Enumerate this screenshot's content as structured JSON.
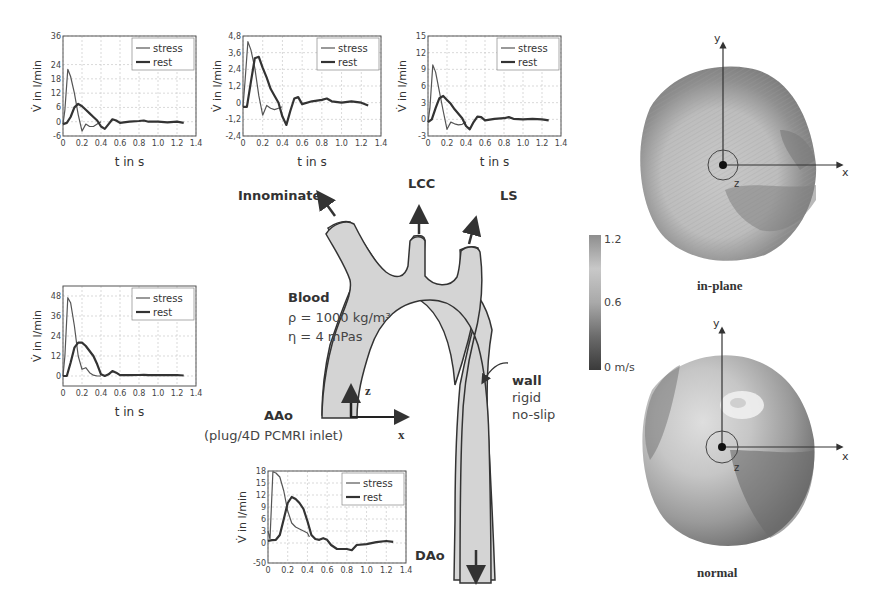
{
  "figure": {
    "aorta": {
      "labels": {
        "innominate": "Innominate",
        "lcc": "LCC",
        "ls": "LS",
        "aao": "AAo",
        "aao_sub": "(plug/4D PCMRI inlet)",
        "dao": "DAo",
        "blood": "Blood",
        "rho": "ρ = 1000 kg/m³",
        "eta": "η =  4 mPas",
        "wall": "wall",
        "wall_l1": "rigid",
        "wall_l2": "no-slip",
        "axis_z": "z",
        "axis_x": "x"
      },
      "fill_color": "#d6d6d6",
      "stroke_color": "#333333"
    },
    "colorbar": {
      "max_label": "1.2",
      "mid_label": "0.6",
      "min_label": "0 m/s"
    },
    "cross_sections": [
      {
        "caption": "in-plane",
        "axis_x": "x",
        "axis_y": "y",
        "axis_z": "z"
      },
      {
        "caption": "normal",
        "axis_x": "x",
        "axis_y": "y",
        "axis_z": "z"
      }
    ]
  },
  "chart_data": [
    {
      "id": "innominate",
      "type": "line",
      "title": "",
      "xlabel": "t in s",
      "ylabel": "V̇ in l/min",
      "xlim": [
        0,
        1.4
      ],
      "ylim": [
        -6,
        36
      ],
      "xticks": [
        "0",
        "0.2",
        "0.4",
        "0.6",
        "0.8",
        "1.0",
        "1.2",
        "1.4"
      ],
      "yticks": [
        "-6",
        "0",
        "6",
        "12",
        "18",
        "24",
        "36"
      ],
      "ytick_values": [
        -6,
        0,
        6,
        12,
        18,
        24,
        36
      ],
      "grid": true,
      "legend": [
        "stress",
        "rest"
      ],
      "legend_position": "upper right",
      "series": [
        {
          "name": "stress",
          "x": [
            0,
            0.02,
            0.05,
            0.08,
            0.12,
            0.16,
            0.2,
            0.24,
            0.28,
            0.32,
            0.36,
            0.4
          ],
          "values": [
            -1,
            5,
            22,
            19,
            12,
            3,
            -4,
            -1,
            -2,
            -2,
            -1,
            0
          ]
        },
        {
          "name": "rest",
          "x": [
            0,
            0.04,
            0.08,
            0.12,
            0.16,
            0.2,
            0.24,
            0.28,
            0.32,
            0.36,
            0.4,
            0.44,
            0.48,
            0.52,
            0.56,
            0.6,
            0.7,
            0.8,
            0.85,
            0.9,
            1.0,
            1.1,
            1.2,
            1.27
          ],
          "values": [
            -1,
            -0.5,
            2,
            6,
            7.5,
            6.5,
            5,
            3.5,
            2,
            0.5,
            -2,
            -3,
            -1,
            1,
            0.5,
            -0.5,
            0,
            0.3,
            0.5,
            0,
            0,
            -0.3,
            0,
            -0.5
          ]
        }
      ]
    },
    {
      "id": "lcc",
      "type": "line",
      "title": "",
      "xlabel": "t in s",
      "ylabel": "V̇ in l/min",
      "xlim": [
        0,
        1.4
      ],
      "ylim": [
        -2.4,
        4.8
      ],
      "xticks": [
        "0",
        "0.2",
        "0.4",
        "0.6",
        "0.8",
        "1.0",
        "1.2",
        "1.4"
      ],
      "yticks": [
        "-2,4",
        "-1,2",
        "0",
        "1,2",
        "2,4",
        "3,6",
        "4,8"
      ],
      "ytick_values": [
        -2.4,
        -1.2,
        0,
        1.2,
        2.4,
        3.6,
        4.8
      ],
      "grid": true,
      "legend": [
        "stress",
        "rest"
      ],
      "legend_position": "upper right",
      "series": [
        {
          "name": "stress",
          "x": [
            0,
            0.02,
            0.05,
            0.08,
            0.12,
            0.16,
            0.2,
            0.24,
            0.28,
            0.32,
            0.36,
            0.4
          ],
          "values": [
            -0.3,
            1.5,
            4.4,
            3.8,
            2.5,
            0.5,
            -0.9,
            -0.2,
            -0.4,
            -0.5,
            -0.4,
            -0.3
          ]
        },
        {
          "name": "rest",
          "x": [
            0,
            0.04,
            0.08,
            0.12,
            0.16,
            0.2,
            0.24,
            0.28,
            0.32,
            0.36,
            0.4,
            0.44,
            0.48,
            0.52,
            0.56,
            0.6,
            0.7,
            0.8,
            0.85,
            0.9,
            1.0,
            1.1,
            1.2,
            1.27
          ],
          "values": [
            -0.3,
            -0.3,
            1.5,
            3.2,
            3.3,
            2.5,
            1.8,
            1.0,
            0.5,
            0,
            -1.0,
            -1.6,
            -0.6,
            0.3,
            0.4,
            -0.1,
            0.1,
            0.2,
            0.3,
            0.1,
            0.0,
            0.1,
            0.0,
            -0.2
          ]
        }
      ]
    },
    {
      "id": "ls",
      "type": "line",
      "title": "",
      "xlabel": "t in s",
      "ylabel": "V̇ in l/min",
      "xlim": [
        0,
        1.4
      ],
      "ylim": [
        -3,
        15
      ],
      "xticks": [
        "0",
        "0.2",
        "0.4",
        "0.6",
        "0.8",
        "1.0",
        "1.2",
        "1.4"
      ],
      "yticks": [
        "-3",
        "0",
        "3",
        "6",
        "9",
        "12",
        "15"
      ],
      "ytick_values": [
        -3,
        0,
        3,
        6,
        9,
        12,
        15
      ],
      "grid": true,
      "legend": [
        "stress",
        "rest"
      ],
      "legend_position": "upper right",
      "series": [
        {
          "name": "stress",
          "x": [
            0,
            0.02,
            0.05,
            0.08,
            0.12,
            0.16,
            0.2,
            0.24,
            0.28,
            0.32,
            0.36,
            0.4
          ],
          "values": [
            -0.5,
            2,
            9.8,
            8.5,
            5,
            1.5,
            -1.8,
            -0.5,
            -0.8,
            -1.0,
            -0.9,
            -0.5
          ]
        },
        {
          "name": "rest",
          "x": [
            0,
            0.04,
            0.08,
            0.12,
            0.16,
            0.2,
            0.24,
            0.28,
            0.32,
            0.36,
            0.4,
            0.44,
            0.48,
            0.52,
            0.56,
            0.6,
            0.7,
            0.8,
            0.85,
            0.9,
            1.0,
            1.1,
            1.2,
            1.27
          ],
          "values": [
            -0.5,
            0,
            2,
            3.8,
            4.2,
            3.5,
            2.8,
            1.8,
            1.0,
            0.2,
            -1.2,
            -1.8,
            -0.5,
            0.5,
            0.4,
            -0.2,
            0.1,
            0.2,
            0.4,
            0.1,
            0.0,
            0.1,
            0.0,
            -0.2
          ]
        }
      ]
    },
    {
      "id": "left-outlet",
      "type": "line",
      "title": "",
      "xlabel": "t in s",
      "ylabel": "V̇ in l/min",
      "xlim": [
        0,
        1.4
      ],
      "ylim": [
        -6,
        54
      ],
      "xticks": [
        "0",
        "0.2",
        "0.4",
        "0.6",
        "0.8",
        "1.0",
        "1.2",
        "1.4"
      ],
      "yticks": [
        "0",
        "12",
        "24",
        "36",
        "48"
      ],
      "ytick_values": [
        0,
        12,
        24,
        36,
        48
      ],
      "grid": true,
      "legend": [
        "stress",
        "rest"
      ],
      "legend_position": "upper right",
      "series": [
        {
          "name": "stress",
          "x": [
            0,
            0.02,
            0.05,
            0.08,
            0.12,
            0.16,
            0.2,
            0.24,
            0.28,
            0.32,
            0.36,
            0.4
          ],
          "values": [
            0,
            12,
            47,
            44,
            30,
            12,
            4,
            5,
            2,
            0.5,
            0,
            0
          ]
        },
        {
          "name": "rest",
          "x": [
            0,
            0.04,
            0.08,
            0.12,
            0.16,
            0.2,
            0.24,
            0.28,
            0.32,
            0.36,
            0.4,
            0.44,
            0.48,
            0.52,
            0.56,
            0.6,
            0.7,
            0.8,
            0.85,
            0.9,
            1.0,
            1.1,
            1.2,
            1.27
          ],
          "values": [
            0,
            0,
            8,
            17,
            20,
            20,
            18,
            15,
            12,
            7,
            1,
            0,
            1,
            3,
            2,
            0.5,
            0.5,
            0.6,
            0.7,
            0.5,
            0.6,
            0.5,
            0.6,
            0.3
          ]
        }
      ]
    },
    {
      "id": "dao",
      "type": "line",
      "title": "",
      "xlabel": "",
      "ylabel": "V̇ in l/min",
      "xlim": [
        0,
        1.4
      ],
      "ylim": [
        -5,
        18
      ],
      "xticks": [
        "0",
        "0.2",
        "0.4",
        "0.6",
        "0.8",
        "1.0",
        "1.2",
        "1.4"
      ],
      "yticks": [
        "-50",
        "0",
        "3",
        "6",
        "9",
        "12",
        "15",
        "18"
      ],
      "ytick_values": [
        -5,
        0,
        3,
        6,
        9,
        12,
        15,
        18
      ],
      "grid": true,
      "legend": [
        "stress",
        "rest"
      ],
      "legend_position": "upper right",
      "series": [
        {
          "name": "stress",
          "x": [
            0,
            0.02,
            0.05,
            0.08,
            0.12,
            0.16,
            0.2,
            0.24,
            0.28,
            0.32,
            0.36,
            0.4,
            0.42
          ],
          "values": [
            3,
            1,
            17.8,
            17.5,
            16.5,
            13,
            8,
            5,
            4,
            3.5,
            3,
            2.5,
            1.5
          ]
        },
        {
          "name": "rest",
          "x": [
            0,
            0.04,
            0.08,
            0.12,
            0.16,
            0.2,
            0.24,
            0.28,
            0.32,
            0.36,
            0.4,
            0.44,
            0.48,
            0.52,
            0.56,
            0.6,
            0.64,
            0.7,
            0.8,
            0.85,
            0.9,
            1.0,
            1.1,
            1.2,
            1.27
          ],
          "values": [
            0.5,
            0.7,
            0.8,
            2,
            6,
            10,
            11.5,
            11,
            10,
            8.5,
            5.5,
            2,
            1,
            0.8,
            1.2,
            0.8,
            -0.5,
            -1.5,
            -1.5,
            -1.8,
            -0.5,
            -0.3,
            0.2,
            0.5,
            0.3
          ]
        }
      ]
    }
  ]
}
